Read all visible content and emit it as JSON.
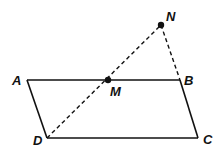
{
  "diagram": {
    "type": "geometry",
    "points": {
      "A": {
        "label": "A",
        "x": 27,
        "y": 80
      },
      "B": {
        "label": "B",
        "x": 180,
        "y": 80
      },
      "C": {
        "label": "C",
        "x": 198,
        "y": 138
      },
      "D": {
        "label": "D",
        "x": 47,
        "y": 138
      },
      "M": {
        "label": "M",
        "x": 108,
        "y": 80
      },
      "N": {
        "label": "N",
        "x": 161,
        "y": 25
      }
    },
    "solid_segments": [
      "AB",
      "BC",
      "CD",
      "DA"
    ],
    "dashed_segments": [
      "DN",
      "NB"
    ],
    "dots": [
      "M",
      "N"
    ]
  }
}
